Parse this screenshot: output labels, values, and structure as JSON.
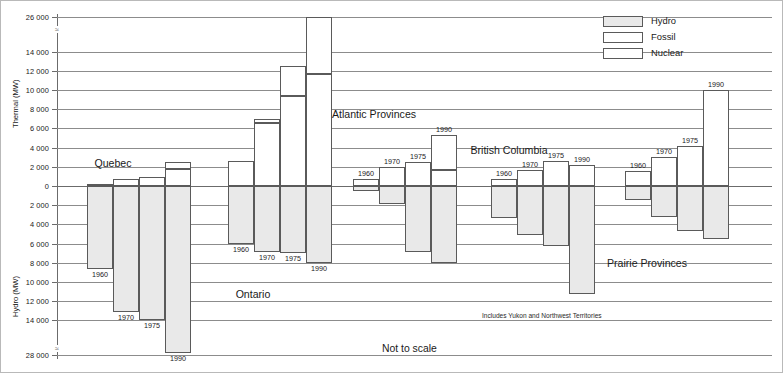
{
  "chart_data": {
    "type": "bar",
    "title": "",
    "subtitle": "",
    "orientation": "vertical-diverging",
    "note_scale": "Not to scale",
    "note_bc": "Includes Yukon and Northwest Territories",
    "axes": {
      "upper_label": "Thermal (MW)",
      "lower_label": "Hydro (MW)",
      "upper_ticks": [
        "26 000",
        "14 000",
        "12 000",
        "10 000",
        "8 000",
        "6 000",
        "4 000",
        "2 000",
        "0"
      ],
      "lower_ticks": [
        "2 000",
        "4 000",
        "6 000",
        "8 000",
        "10 000",
        "12 000",
        "14 000",
        "28 000"
      ],
      "upper_axis_broken_between": [
        "14 000",
        "26 000"
      ],
      "lower_axis_broken_between": [
        "14 000",
        "28 000"
      ],
      "grid": true,
      "zero_line": "0"
    },
    "legend": {
      "position": "top-right",
      "entries": [
        {
          "label": "Hydro",
          "swatch": "#e9e9e9"
        },
        {
          "label": "Fossil",
          "swatch": "#ffffff"
        },
        {
          "label": "Nuclear",
          "swatch": "#ffffff"
        }
      ]
    },
    "regions": [
      {
        "name": "Quebec",
        "label_position": "above",
        "years": [
          {
            "year": "1960",
            "hydro": 8600,
            "fossil": 200,
            "nuclear": 0
          },
          {
            "year": "1970",
            "hydro": 13100,
            "fossil": 700,
            "nuclear": 0
          },
          {
            "year": "1975",
            "hydro": 14000,
            "fossil": 900,
            "nuclear": 0
          },
          {
            "year": "1990",
            "hydro": 27300,
            "fossil": 1800,
            "nuclear": 700
          }
        ]
      },
      {
        "name": "Ontario",
        "label_position": "below",
        "years": [
          {
            "year": "1960",
            "hydro": 6000,
            "fossil": 2600,
            "nuclear": 0
          },
          {
            "year": "1970",
            "hydro": 6900,
            "fossil": 6600,
            "nuclear": 400
          },
          {
            "year": "1975",
            "hydro": 7000,
            "fossil": 9400,
            "nuclear": 3100
          },
          {
            "year": "1990",
            "hydro": 8000,
            "fossil": 11700,
            "nuclear": 14300
          }
        ]
      },
      {
        "name": "Atlantic Provinces",
        "label_position": "above",
        "years": [
          {
            "year": "1960",
            "hydro": 500,
            "fossil": 700,
            "nuclear": 0
          },
          {
            "year": "1970",
            "hydro": 1900,
            "fossil": 2000,
            "nuclear": 0
          },
          {
            "year": "1975",
            "hydro": 6900,
            "fossil": 2500,
            "nuclear": 0
          },
          {
            "year": "1990",
            "hydro": 8000,
            "fossil": 1700,
            "nuclear": 3600
          }
        ]
      },
      {
        "name": "British Columbia",
        "label_position": "above",
        "years": [
          {
            "year": "1960",
            "hydro": 3300,
            "fossil": 700,
            "nuclear": 0
          },
          {
            "year": "1970",
            "hydro": 5100,
            "fossil": 1700,
            "nuclear": 0
          },
          {
            "year": "1975",
            "hydro": 6300,
            "fossil": 2600,
            "nuclear": 0
          },
          {
            "year": "1990",
            "hydro": 11200,
            "fossil": 2200,
            "nuclear": 0
          }
        ]
      },
      {
        "name": "Prairie Provinces",
        "label_position": "below",
        "years": [
          {
            "year": "1960",
            "hydro": 1500,
            "fossil": 1600,
            "nuclear": 0
          },
          {
            "year": "1970",
            "hydro": 3200,
            "fossil": 3000,
            "nuclear": 0
          },
          {
            "year": "1975",
            "hydro": 4700,
            "fossil": 4200,
            "nuclear": 0
          },
          {
            "year": "1990",
            "hydro": 5500,
            "fossil": 10000,
            "nuclear": 0
          }
        ]
      }
    ]
  }
}
